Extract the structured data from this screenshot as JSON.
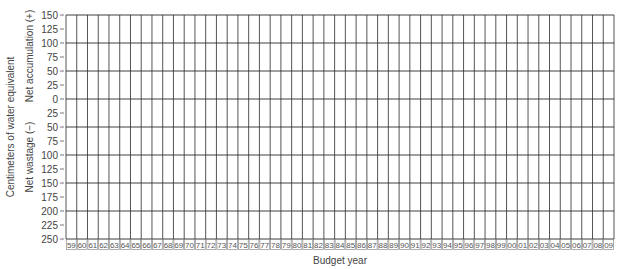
{
  "chart_data": {
    "type": "line",
    "title": "",
    "xlabel": "Budget year",
    "ylabel": "Centimeters of water equivalent",
    "ylabel_upper": "Net accumulation (+)",
    "ylabel_lower": "Net wastage (−)",
    "x": [
      "59",
      "60",
      "61",
      "62",
      "63",
      "64",
      "65",
      "66",
      "67",
      "68",
      "69",
      "70",
      "71",
      "72",
      "73",
      "74",
      "75",
      "76",
      "77",
      "78",
      "79",
      "80",
      "81",
      "82",
      "83",
      "84",
      "85",
      "86",
      "87",
      "88",
      "89",
      "90",
      "91",
      "92",
      "93",
      "94",
      "95",
      "96",
      "97",
      "98",
      "99",
      "00",
      "01",
      "02",
      "03",
      "04",
      "05",
      "06",
      "07",
      "08",
      "09"
    ],
    "y_ticks": [
      {
        "value": 150,
        "label": "150"
      },
      {
        "value": 125,
        "label": "125"
      },
      {
        "value": 100,
        "label": "100"
      },
      {
        "value": 75,
        "label": "75"
      },
      {
        "value": 50,
        "label": "50"
      },
      {
        "value": 25,
        "label": "25"
      },
      {
        "value": 0,
        "label": "0"
      },
      {
        "value": -25,
        "label": "25"
      },
      {
        "value": -50,
        "label": "50"
      },
      {
        "value": -75,
        "label": "75"
      },
      {
        "value": -100,
        "label": "100"
      },
      {
        "value": -125,
        "label": "125"
      },
      {
        "value": -150,
        "label": "150"
      },
      {
        "value": -175,
        "label": "175"
      },
      {
        "value": -200,
        "label": "200"
      },
      {
        "value": -225,
        "label": "225"
      },
      {
        "value": -250,
        "label": "250"
      }
    ],
    "ylim": [
      -250,
      150
    ],
    "major_gridlines": [
      150,
      100,
      50,
      0,
      -50,
      -100,
      -150,
      -200,
      -250
    ],
    "grid": true,
    "series": [],
    "note": "Blank worksheet grid; no data plotted"
  },
  "colors": {
    "grid": "#2a2a2a",
    "tick": "#555555",
    "text": "#444444",
    "year_cell_border": "#777777"
  }
}
